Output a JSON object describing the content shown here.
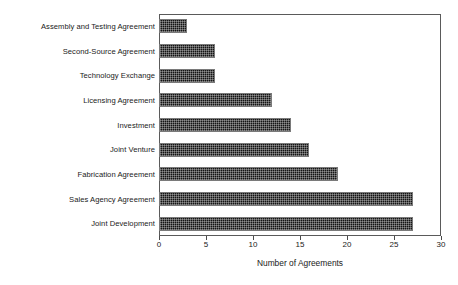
{
  "chart_data": {
    "type": "bar",
    "orientation": "horizontal",
    "title": "",
    "xlabel": "Number of Agreements",
    "ylabel": "",
    "xlim": [
      0,
      30
    ],
    "xticks": [
      0,
      5,
      10,
      15,
      20,
      25,
      30
    ],
    "grid": false,
    "legend": null,
    "categories": [
      "Assembly and Testing Agreement",
      "Second-Source Agreement",
      "Technology Exchange",
      "Licensing Agreement",
      "Investment",
      "Joint Venture",
      "Fabrication Agreement",
      "Sales Agency Agreement",
      "Joint Development"
    ],
    "values": [
      3,
      6,
      6,
      12,
      14,
      16,
      19,
      27,
      27
    ],
    "bar_fill_color": "#141414",
    "bar_edge_color": "#7a7a7a",
    "frame_color": "#5a5a5a",
    "background_color": "#ffffff"
  }
}
